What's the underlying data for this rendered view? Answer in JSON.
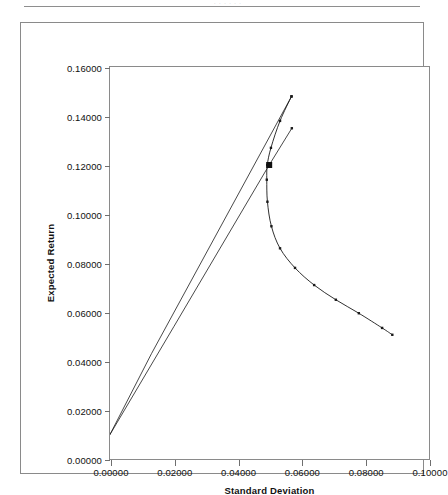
{
  "page": {
    "scan_header_text": "· · · · · ·"
  },
  "chart_data": {
    "type": "line",
    "title": "",
    "xlabel": "Standard Deviation",
    "ylabel": "Expected Return",
    "xlim": [
      0.0,
      0.1
    ],
    "ylim": [
      0.0,
      0.16
    ],
    "xticks": [
      "0.00000",
      "0.02000",
      "0.04000",
      "0.06000",
      "0.08000",
      "0.10000"
    ],
    "xtick_values": [
      0.0,
      0.02,
      0.04,
      0.06,
      0.08,
      0.1
    ],
    "yticks": [
      "0.00000",
      "0.02000",
      "0.04000",
      "0.06000",
      "0.08000",
      "0.10000",
      "0.12000",
      "0.14000",
      "0.16000"
    ],
    "ytick_values": [
      0.0,
      0.02,
      0.04,
      0.06,
      0.08,
      0.1,
      0.12,
      0.14,
      0.16
    ],
    "grid": false,
    "legend": "none",
    "series": [
      {
        "name": "Capital Allocation Line (upper)",
        "type": "line",
        "markers": false,
        "x": [
          0.0,
          0.013,
          0.0569
        ],
        "y": [
          0.01,
          0.043,
          0.148
        ]
      },
      {
        "name": "Capital Allocation Line (tangency)",
        "type": "line",
        "markers": false,
        "x": [
          0.0,
          0.02,
          0.0499,
          0.057
        ],
        "y": [
          0.01,
          0.054,
          0.12,
          0.135
        ]
      },
      {
        "name": "Minimum Variance Frontier",
        "type": "line",
        "markers": true,
        "x": [
          0.0569,
          0.0533,
          0.05045,
          0.0493,
          0.04915,
          0.04935,
          0.0506,
          0.0533,
          0.058,
          0.064,
          0.0708,
          0.078,
          0.0853,
          0.0885
        ],
        "y": [
          0.148,
          0.138,
          0.127,
          0.12,
          0.114,
          0.105,
          0.095,
          0.086,
          0.078,
          0.071,
          0.065,
          0.0595,
          0.0535,
          0.0507
        ]
      }
    ],
    "markers": [
      {
        "name": "tangency-portfolio",
        "x": 0.0499,
        "y": 0.12,
        "shape": "square",
        "color": "#101010",
        "size": 6
      }
    ],
    "colors": {
      "line": "#1a1a1a",
      "axis": "#8a8a8a",
      "tick": "#6f6f6f",
      "text": "#111111",
      "background": "#ffffff"
    }
  }
}
